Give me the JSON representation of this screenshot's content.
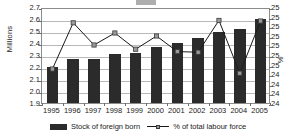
{
  "chart_data": {
    "type": "bar",
    "title": "",
    "xlabel": "",
    "ylabel": "Millions",
    "ylabel_right": "%",
    "categories": [
      "1995",
      "1996",
      "1997",
      "1998",
      "1999",
      "2000",
      "2001",
      "2002",
      "2003",
      "2004",
      "2005"
    ],
    "ylim": [
      1.9,
      2.7
    ],
    "ylim_right": [
      24.0,
      25.0
    ],
    "y_ticks": [
      "1.9",
      "2.0",
      "2.1",
      "2.2",
      "2.3",
      "2.4",
      "2.5",
      "2.6",
      "2.7"
    ],
    "y_ticks_right": [
      "24",
      "24",
      "24",
      "24",
      "25",
      "25",
      "25",
      "25",
      "25",
      "25",
      "25"
    ],
    "grid": true,
    "legend_position": "bottom",
    "series": [
      {
        "name": "Stock of foreign born",
        "type": "bar",
        "axis": "left",
        "unit": "Millions",
        "color": "#2b2b2b",
        "values": [
          2.2,
          2.27,
          2.27,
          2.31,
          2.32,
          2.37,
          2.4,
          2.44,
          2.49,
          2.52,
          2.6
        ]
      },
      {
        "name": "% of total labour force",
        "type": "line",
        "axis": "right",
        "unit": "%",
        "color": "#1a1a1a",
        "marker_color": "#9a9a9a",
        "values_plot": [
          2.2,
          2.585,
          2.4,
          2.5,
          2.365,
          2.475,
          2.345,
          2.34,
          2.605,
          2.165,
          2.6
        ]
      }
    ]
  },
  "axes": {
    "left_label": "Millions",
    "right_label": "%",
    "left_ticks": [
      "2.7",
      "2.6",
      "2.5",
      "2.4",
      "2.3",
      "2.2",
      "2.1",
      "2.0",
      "1.9"
    ],
    "right_ticks": [
      "25",
      "25",
      "25",
      "25",
      "25",
      "25",
      "25",
      "24",
      "24",
      "24",
      "24"
    ]
  },
  "legend": {
    "items": [
      {
        "label": "Stock of foreign born",
        "marker": "bar-swatch"
      },
      {
        "label": "% of total labour force",
        "marker": "line-marker-swatch"
      }
    ]
  }
}
